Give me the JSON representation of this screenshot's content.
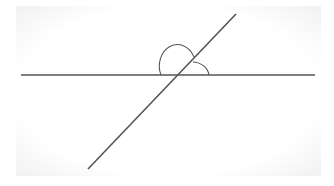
{
  "diagram": {
    "type": "intersecting-lines-angles",
    "stroke_color": "#555555",
    "background": "#ffffff",
    "horizontal_line": {
      "x1": 21,
      "y1": 75,
      "x2": 315,
      "y2": 75
    },
    "transversal_line": {
      "x1": 236,
      "y1": 14,
      "x2": 88,
      "y2": 169
    },
    "intersection": {
      "x": 177,
      "y": 75
    },
    "angle_arcs": [
      {
        "name": "obtuse-angle-arc",
        "path": "M161,75 A17,20 0 0 1 194,57"
      },
      {
        "name": "acute-angle-arc",
        "path": "M193,62 A17,15 0 0 1 209,75"
      }
    ]
  }
}
